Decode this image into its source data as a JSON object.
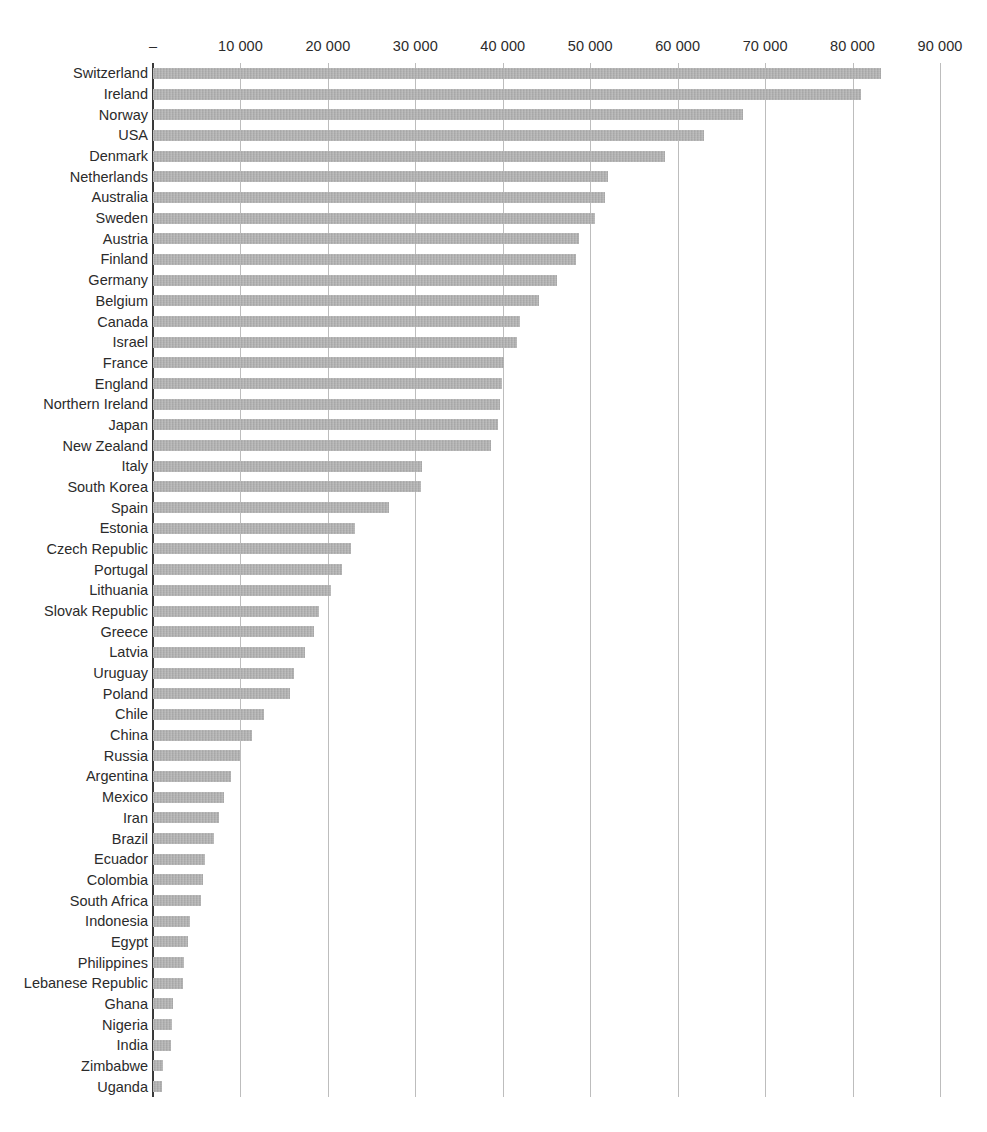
{
  "chart_data": {
    "type": "bar",
    "orientation": "horizontal",
    "title": "",
    "subtitle": "",
    "xlabel": "",
    "ylabel": "",
    "grid": true,
    "legend": false,
    "xlim": [
      0,
      90000
    ],
    "xticks": [
      0,
      10000,
      20000,
      30000,
      40000,
      50000,
      60000,
      70000,
      80000,
      90000
    ],
    "xtick_labels": [
      "–",
      "10 000",
      "20 000",
      "30 000",
      "40 000",
      "50 000",
      "60 000",
      "70 000",
      "80 000",
      "90 000"
    ],
    "bar_color": "#aaaaaa",
    "axis_color": "#3a3a3a",
    "grid_color": "#bdbdbd",
    "categories": [
      "Switzerland",
      "Ireland",
      "Norway",
      "USA",
      "Denmark",
      "Netherlands",
      "Australia",
      "Sweden",
      "Austria",
      "Finland",
      "Germany",
      "Belgium",
      "Canada",
      "Israel",
      "France",
      "England",
      "Northern Ireland",
      "Japan",
      "New Zealand",
      "Italy",
      "South Korea",
      "Spain",
      "Estonia",
      "Czech Republic",
      "Portugal",
      "Lithuania",
      "Slovak Republic",
      "Greece",
      "Latvia",
      "Uruguay",
      "Poland",
      "Chile",
      "China",
      "Russia",
      "Argentina",
      "Mexico",
      "Iran",
      "Brazil",
      "Ecuador",
      "Colombia",
      "South Africa",
      "Indonesia",
      "Egypt",
      "Philippines",
      "Lebanese Republic",
      "Ghana",
      "Nigeria",
      "India",
      "Zimbabwe",
      "Uganda"
    ],
    "values": [
      83200,
      81000,
      67500,
      63000,
      58500,
      52000,
      51700,
      50500,
      48700,
      48400,
      46200,
      44100,
      42000,
      41600,
      40100,
      39900,
      39700,
      39500,
      38700,
      30800,
      30600,
      27000,
      23100,
      22600,
      21600,
      20400,
      19000,
      18400,
      17400,
      16100,
      15700,
      12700,
      11300,
      9900,
      8900,
      8100,
      7600,
      7000,
      6000,
      5700,
      5500,
      4200,
      4000,
      3600,
      3400,
      2300,
      2200,
      2100,
      1200,
      1000
    ]
  }
}
